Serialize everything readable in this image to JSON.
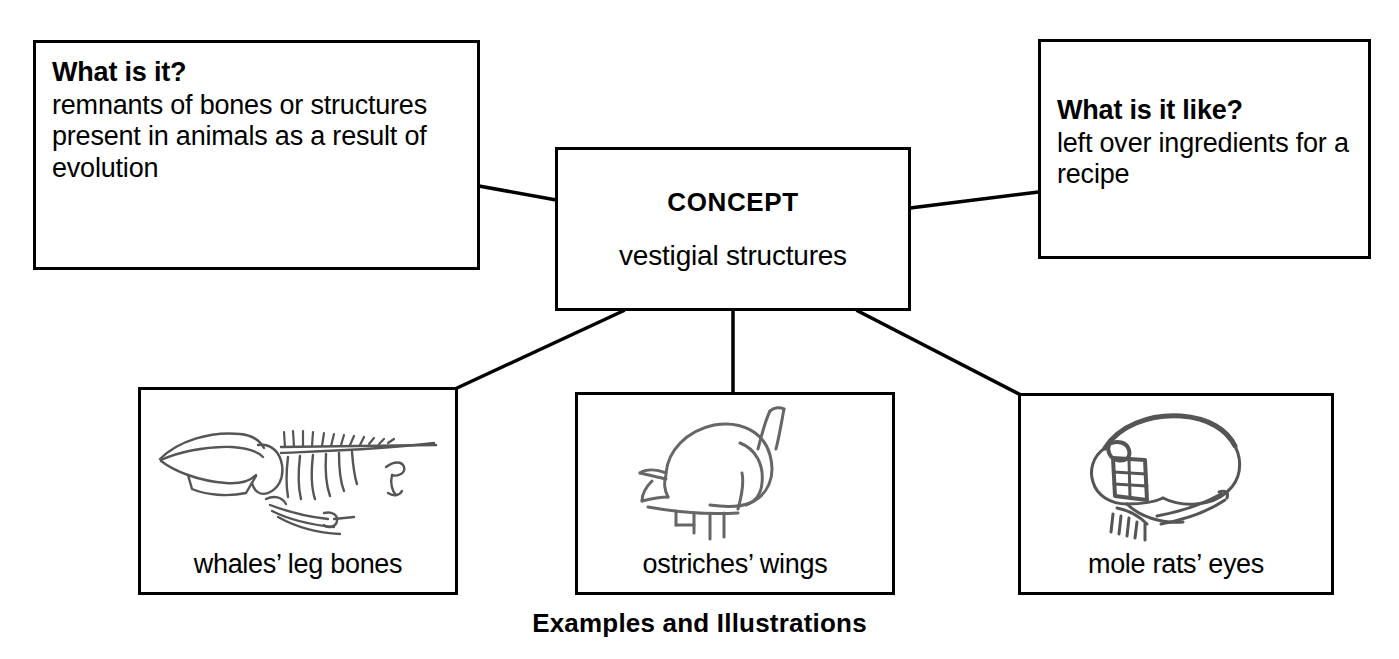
{
  "diagram": {
    "title_caption": "Examples and Illustrations",
    "ink_color": "#000000",
    "background_color": "#ffffff"
  },
  "concept": {
    "title": "CONCEPT",
    "term": "vestigial structures"
  },
  "definition": {
    "heading": "What is it?",
    "body": "remnants of bones or structures present in animals as a result of evolution"
  },
  "analogy": {
    "heading": "What is it like?",
    "body": "left over ingredients for a recipe"
  },
  "examples": [
    {
      "label": "whales’ leg bones",
      "sketch_name": "whale-skeleton-sketch"
    },
    {
      "label": "ostriches’ wings",
      "sketch_name": "ostrich-sketch"
    },
    {
      "label": "mole rats’ eyes",
      "sketch_name": "mole-rat-head-sketch"
    }
  ],
  "connectors": [
    {
      "name": "definition-to-concept"
    },
    {
      "name": "concept-to-analogy"
    },
    {
      "name": "concept-to-example-whales"
    },
    {
      "name": "concept-to-example-ostriches"
    },
    {
      "name": "concept-to-example-mole-rats"
    }
  ]
}
